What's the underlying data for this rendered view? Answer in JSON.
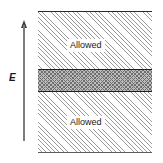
{
  "figure": {
    "type": "energy-band-diagram",
    "axis": {
      "label": "E",
      "direction": "up",
      "icon": "up-arrow-icon"
    },
    "bands": [
      {
        "id": "upper",
        "label": "Allowed",
        "kind": "allowed"
      },
      {
        "id": "gap",
        "label": "",
        "kind": "forbidden"
      },
      {
        "id": "lower",
        "label": "Allowed",
        "kind": "allowed"
      }
    ],
    "colors": {
      "hatch": "#9a9a9a",
      "gap_fill": "#bcbcbc",
      "gap_hatch": "#6f6f6f",
      "rule": "#1e1e1e",
      "axis": "#7d7d7d",
      "text": "#1a1a1a",
      "background": "#ffffff"
    }
  }
}
